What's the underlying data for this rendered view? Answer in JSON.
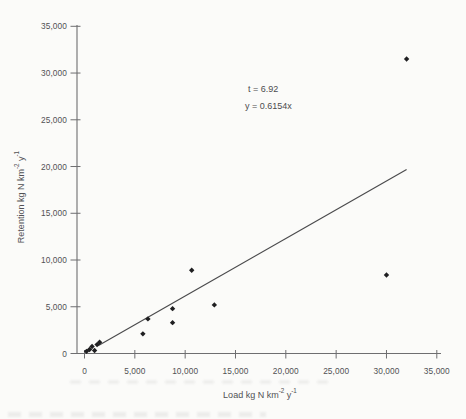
{
  "chart_data": {
    "type": "scatter",
    "title": "",
    "xlabel": "Load kg N km-2 y-1",
    "ylabel": "Retention kg N km-2 y-1",
    "xlabel_parts": {
      "text": "Load kg N km",
      "sup_a": "-2",
      "mid": " y",
      "sup_b": "-1"
    },
    "ylabel_parts": {
      "text": "Retention kg N km",
      "sup_a": "-2",
      "mid": " y",
      "sup_b": "-1"
    },
    "xlim": [
      0,
      35000
    ],
    "ylim": [
      0,
      35000
    ],
    "xticks": [
      0,
      5000,
      10000,
      15000,
      20000,
      25000,
      30000,
      35000
    ],
    "yticks": [
      0,
      5000,
      10000,
      15000,
      20000,
      25000,
      30000,
      35000
    ],
    "xtick_labels": [
      "0",
      "5,000",
      "10,000",
      "15,000",
      "20,000",
      "25,000",
      "30,000",
      "35,000"
    ],
    "ytick_labels": [
      "0",
      "5,000",
      "10,000",
      "15,000",
      "20,000",
      "25,000",
      "30,000",
      "35,000"
    ],
    "grid": false,
    "legend": false,
    "marker": "diamond",
    "points": [
      [
        200,
        230
      ],
      [
        500,
        430
      ],
      [
        750,
        750
      ],
      [
        1000,
        320
      ],
      [
        1250,
        950
      ],
      [
        1500,
        1200
      ],
      [
        5800,
        2100
      ],
      [
        6300,
        3700
      ],
      [
        8750,
        3300
      ],
      [
        8750,
        4800
      ],
      [
        10650,
        8900
      ],
      [
        12900,
        5200
      ],
      [
        30000,
        8400
      ],
      [
        32000,
        31500
      ]
    ],
    "trendline": {
      "equation": "y = 0.6154x",
      "slope": 0.6154,
      "intercept": 0,
      "x_start": 1350,
      "x_end": 32000
    },
    "annotations": [
      {
        "text": "t = 6.92"
      },
      {
        "text": "y = 0.6154x"
      }
    ]
  },
  "colors": {
    "background": "#fbfbf9",
    "axis": "#6e6e70",
    "tick_text": "#515154",
    "marker": "#1f1f21",
    "trendline": "#4a4a4c"
  }
}
